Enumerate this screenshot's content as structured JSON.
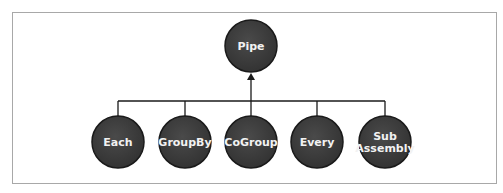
{
  "diagram": {
    "root": {
      "id": "pipe",
      "label": "Pipe"
    },
    "children": [
      {
        "id": "each",
        "lines": [
          "Each"
        ]
      },
      {
        "id": "groupby",
        "lines": [
          "GroupBy"
        ]
      },
      {
        "id": "cogroup",
        "lines": [
          "CoGroup"
        ]
      },
      {
        "id": "every",
        "lines": [
          "Every"
        ]
      },
      {
        "id": "subassembly",
        "lines": [
          "Sub",
          "Assembly"
        ]
      }
    ],
    "relation": "children inherit from root (arrow points to Pipe)",
    "colors": {
      "node_fill": "#3d3d3d",
      "node_stroke": "#1a1a1a",
      "text": "#f2f2f2",
      "line": "#1a1a1a",
      "frame": "#a8a8a8"
    }
  }
}
